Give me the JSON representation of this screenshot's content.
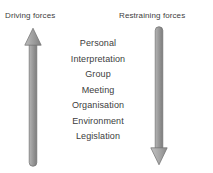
{
  "diagram": {
    "type": "force-field-analysis",
    "background_color": "#ffffff",
    "text_color": "#3d3d3d",
    "arrow_color": "#9a9a9a",
    "arrow_edge_color": "#6e6e6e"
  },
  "headings": {
    "driving": "Driving forces",
    "restraining": "Restraining forces"
  },
  "arrows": [
    {
      "name": "driving-forces-arrow",
      "direction": "up",
      "head": "top",
      "tail": "rounded",
      "color": "#9a9a9a"
    },
    {
      "name": "restraining-forces-arrow",
      "direction": "down",
      "head": "bottom",
      "tail": "rounded",
      "color": "#9a9a9a"
    }
  ],
  "factors": [
    "Personal",
    "Interpretation",
    "Group",
    "Meeting",
    "Organisation",
    "Environment",
    "Legislation"
  ]
}
